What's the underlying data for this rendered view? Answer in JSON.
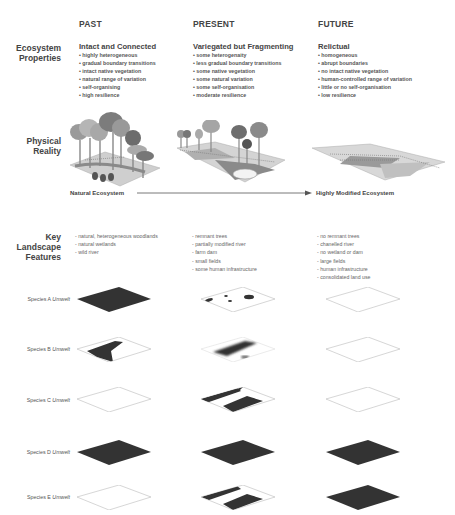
{
  "columns": [
    {
      "id": "past",
      "label": "PAST"
    },
    {
      "id": "present",
      "label": "PRESENT"
    },
    {
      "id": "future",
      "label": "FUTURE"
    }
  ],
  "rows": {
    "ecosystem_properties": "Ecosystem Properties",
    "ecosystem_properties_line1": "Ecosystem",
    "ecosystem_properties_line2": "Properties",
    "physical_reality_line1": "Physical",
    "physical_reality_line2": "Reality",
    "key_features_line1": "Key",
    "key_features_line2": "Landscape",
    "key_features_line3": "Features"
  },
  "properties": {
    "past": {
      "title": "Intact and Connected",
      "items": [
        "highly heterogeneous",
        "gradual boundary transitions",
        "intact native vegetation",
        "natural range of variation",
        "self-organising",
        "high resilience"
      ]
    },
    "present": {
      "title": "Variegated but Fragmenting",
      "items": [
        "some heterogenaity",
        "less gradual boundary transitions",
        "some native vegetation",
        "some natural variation",
        "some self-organisation",
        "moderate resilience"
      ]
    },
    "future": {
      "title": "Relictual",
      "items": [
        "homogeneous",
        "abrupt boundaries",
        "no intact native vegetation",
        "human-controlled range of variation",
        "little or no self-organisation",
        "low resilience"
      ]
    }
  },
  "gradient_axis": {
    "start_label": "Natural Ecosystem",
    "end_label": "Highly Modified Ecosystem"
  },
  "features": {
    "past": [
      "natural, heterogeneous woodlands",
      "natural wetlands",
      "wild river"
    ],
    "present": [
      "remnant trees",
      "partially modified river",
      "farm dam",
      "small fields",
      "some human infrastructure"
    ],
    "future": [
      "no remnant trees",
      "chanelled river",
      "no wetland or dam",
      "large fields",
      "human infrastructure",
      "consolidated land use"
    ]
  },
  "species": [
    {
      "name": "Species A",
      "suffix": "Umwelt",
      "past": "full",
      "present": "patches",
      "future": "empty"
    },
    {
      "name": "Species B",
      "suffix": "Umwelt",
      "past": "river-wedge",
      "present": "blurred-band",
      "future": "empty"
    },
    {
      "name": "Species C",
      "suffix": "Umwelt",
      "past": "empty",
      "present": "fields",
      "future": "empty"
    },
    {
      "name": "Species D",
      "suffix": "Umwelt",
      "past": "full",
      "present": "full",
      "future": "full"
    },
    {
      "name": "Species E",
      "suffix": "Umwelt",
      "past": "empty",
      "present": "fields",
      "future": "full"
    }
  ],
  "colors": {
    "fill_dark": "#333333",
    "outline": "#bbbbbb",
    "text": "#444444"
  }
}
